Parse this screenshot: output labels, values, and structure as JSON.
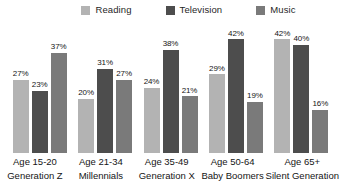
{
  "chart_data": {
    "type": "bar",
    "title": "",
    "subtitle": "",
    "xlabel": "",
    "ylabel": "",
    "ylim": [
      0,
      45
    ],
    "grid": false,
    "legend_position": "top-center",
    "value_label_suffix": "%",
    "categories": [
      "Age 15-20\nGeneration Z",
      "Age 21-34\nMillennials",
      "Age 35-49\nGeneration X",
      "Age 50-64\nBaby Boomers",
      "Age 65+\nSilent Generation"
    ],
    "series": [
      {
        "name": "Reading",
        "color": "#b3b3b3",
        "values": [
          27,
          20,
          24,
          29,
          42
        ]
      },
      {
        "name": "Television",
        "color": "#4d4d4d",
        "values": [
          23,
          31,
          38,
          42,
          40
        ]
      },
      {
        "name": "Music",
        "color": "#7a7a7a",
        "values": [
          37,
          27,
          21,
          19,
          16
        ]
      }
    ]
  },
  "legend": {
    "items": [
      {
        "label": "Reading",
        "color": "#b3b3b3"
      },
      {
        "label": "Television",
        "color": "#4d4d4d"
      },
      {
        "label": "Music",
        "color": "#7a7a7a"
      }
    ]
  },
  "groups": [
    {
      "line1": "Age 15-20",
      "line2": "Generation Z",
      "bars": [
        {
          "series": "Reading",
          "label": "27%",
          "value": 27,
          "color": "#b3b3b3"
        },
        {
          "series": "Television",
          "label": "23%",
          "value": 23,
          "color": "#4d4d4d"
        },
        {
          "series": "Music",
          "label": "37%",
          "value": 37,
          "color": "#7a7a7a"
        }
      ]
    },
    {
      "line1": "Age 21-34",
      "line2": "Millennials",
      "bars": [
        {
          "series": "Reading",
          "label": "20%",
          "value": 20,
          "color": "#b3b3b3"
        },
        {
          "series": "Television",
          "label": "31%",
          "value": 31,
          "color": "#4d4d4d"
        },
        {
          "series": "Music",
          "label": "27%",
          "value": 27,
          "color": "#7a7a7a"
        }
      ]
    },
    {
      "line1": "Age 35-49",
      "line2": "Generation X",
      "bars": [
        {
          "series": "Reading",
          "label": "24%",
          "value": 24,
          "color": "#b3b3b3"
        },
        {
          "series": "Television",
          "label": "38%",
          "value": 38,
          "color": "#4d4d4d"
        },
        {
          "series": "Music",
          "label": "21%",
          "value": 21,
          "color": "#7a7a7a"
        }
      ]
    },
    {
      "line1": "Age 50-64",
      "line2": "Baby Boomers",
      "bars": [
        {
          "series": "Reading",
          "label": "29%",
          "value": 29,
          "color": "#b3b3b3"
        },
        {
          "series": "Television",
          "label": "42%",
          "value": 42,
          "color": "#4d4d4d"
        },
        {
          "series": "Music",
          "label": "19%",
          "value": 19,
          "color": "#7a7a7a"
        }
      ]
    },
    {
      "line1": "Age 65+",
      "line2": "Silent Generation",
      "bars": [
        {
          "series": "Reading",
          "label": "42%",
          "value": 42,
          "color": "#b3b3b3"
        },
        {
          "series": "Television",
          "label": "40%",
          "value": 40,
          "color": "#4d4d4d"
        },
        {
          "series": "Music",
          "label": "16%",
          "value": 16,
          "color": "#7a7a7a"
        }
      ]
    }
  ]
}
